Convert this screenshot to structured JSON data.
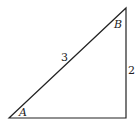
{
  "diagram": {
    "type": "right-triangle",
    "vertices": {
      "A": {
        "label": "A",
        "x": 9,
        "y": 118
      },
      "B": {
        "label": "B",
        "x": 126,
        "y": 8
      },
      "C": {
        "x": 126,
        "y": 118
      }
    },
    "sides": {
      "hypotenuse": {
        "label": "3"
      },
      "vertical_leg": {
        "label": "2"
      }
    },
    "stroke_color": "#222222"
  }
}
